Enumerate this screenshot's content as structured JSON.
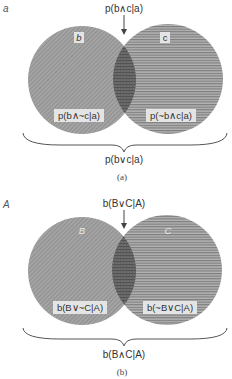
{
  "colors": {
    "left_fill": "#9c9c9c",
    "right_fill": "#a8a8a8",
    "right_stripe": "#7a7a7a",
    "overlap_fill": "#666666",
    "label_bg": "#e6e6e6",
    "stroke": "#555555"
  },
  "panels": [
    {
      "panel_letter": "a",
      "top_label": "p(b∧c|a)",
      "left_circle_label": "b",
      "right_circle_label": "c",
      "left_region_label": "p(b∧~c|a)",
      "right_region_label": "p(~b∧c|a)",
      "brace_label": "p(b∨c|a)",
      "caption": "(a)"
    },
    {
      "panel_letter": "A",
      "top_label": "b(B∨C|A)",
      "left_circle_label": "B",
      "right_circle_label": "C",
      "left_region_label": "b(B∨~C|A)",
      "right_region_label": "b(~B∨C|A)",
      "brace_label": "b(B∧C|A)",
      "caption": "(b)"
    }
  ]
}
